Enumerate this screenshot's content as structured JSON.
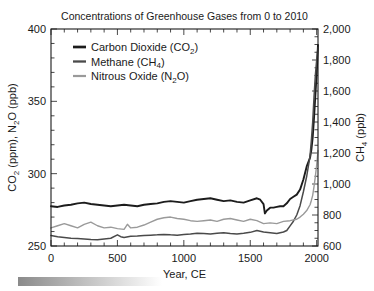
{
  "chart_data": {
    "type": "line",
    "title": "Concentrations of Greenhouse Gases from 0 to 2010",
    "xlabel": "Year, CE",
    "ylabel_left": "CO2 (ppm), N2O (ppb)",
    "ylabel_right": "CH4 (ppb)",
    "ylabel_left_parts": [
      "CO",
      "2",
      " (ppm), N",
      "2",
      "O (ppb)"
    ],
    "ylabel_right_parts": [
      "CH",
      "4",
      " (ppb)"
    ],
    "xlim": [
      0,
      2010
    ],
    "xticks": [
      0,
      500,
      1000,
      1500,
      2000
    ],
    "xtick_labels": [
      "0",
      "500",
      "1000",
      "1500",
      "2000"
    ],
    "x_minor_step": 100,
    "ylim_left": [
      250,
      400
    ],
    "yticks_left": [
      250,
      300,
      350,
      400
    ],
    "ytick_labels_left": [
      "250",
      "300",
      "350",
      "400"
    ],
    "y_left_minor_step": 10,
    "ylim_right": [
      600,
      2000
    ],
    "yticks_right": [
      600,
      800,
      1000,
      1200,
      1400,
      1600,
      1800,
      2000
    ],
    "ytick_labels_right": [
      "600",
      "800",
      "1,000",
      "1,200",
      "1,400",
      "1,600",
      "1,800",
      "2,000"
    ],
    "y_right_minor_step": 50,
    "grid": false,
    "legend_position": "upper-left-inside",
    "series": [
      {
        "name": "Carbon Dioxide (CO2)",
        "label_parts": [
          "Carbon Dioxide (CO",
          "2",
          ")"
        ],
        "axis": "left",
        "color": "#1c1c1c",
        "width": 1.9,
        "x": [
          0,
          50,
          100,
          150,
          200,
          250,
          300,
          350,
          400,
          450,
          500,
          550,
          600,
          650,
          700,
          750,
          800,
          850,
          900,
          950,
          1000,
          1050,
          1100,
          1150,
          1200,
          1250,
          1300,
          1350,
          1400,
          1450,
          1500,
          1550,
          1575,
          1600,
          1610,
          1625,
          1650,
          1675,
          1700,
          1725,
          1750,
          1775,
          1800,
          1825,
          1850,
          1875,
          1900,
          1925,
          1950,
          1960,
          1970,
          1980,
          1990,
          2000,
          2010
        ],
        "y": [
          277.5,
          277.0,
          278.0,
          278.5,
          279.5,
          280.0,
          279.0,
          278.5,
          278.0,
          277.5,
          278.0,
          278.5,
          278.0,
          277.5,
          278.5,
          279.0,
          279.5,
          280.5,
          281.0,
          280.5,
          280.0,
          281.0,
          282.0,
          282.5,
          283.0,
          282.0,
          281.0,
          281.5,
          280.5,
          280.0,
          281.5,
          283.0,
          282.0,
          279.0,
          272.5,
          274.5,
          276.5,
          276.5,
          277.0,
          277.5,
          277.5,
          279.5,
          282.5,
          284.0,
          285.5,
          289.0,
          296.0,
          305.0,
          311.0,
          316.5,
          325.0,
          338.5,
          354.0,
          369.0,
          389.0
        ]
      },
      {
        "name": "Methane (CH4)",
        "label_parts": [
          "Methane (CH",
          "4",
          ")"
        ],
        "axis": "right",
        "color": "#4a4a4a",
        "width": 1.5,
        "x": [
          0,
          50,
          100,
          150,
          200,
          250,
          300,
          350,
          400,
          450,
          500,
          525,
          550,
          600,
          650,
          700,
          750,
          800,
          850,
          900,
          950,
          1000,
          1050,
          1100,
          1150,
          1200,
          1250,
          1300,
          1350,
          1400,
          1450,
          1500,
          1550,
          1600,
          1650,
          1700,
          1750,
          1775,
          1800,
          1825,
          1850,
          1875,
          1900,
          1925,
          1950,
          1960,
          1970,
          1980,
          1990,
          2000,
          2010
        ],
        "y": [
          668,
          660,
          655,
          650,
          648,
          645,
          642,
          640,
          645,
          650,
          672,
          660,
          655,
          663,
          665,
          668,
          670,
          672,
          675,
          672,
          670,
          675,
          678,
          682,
          680,
          678,
          682,
          685,
          680,
          678,
          682,
          688,
          700,
          690,
          685,
          680,
          690,
          700,
          730,
          760,
          800,
          860,
          950,
          1050,
          1180,
          1280,
          1400,
          1560,
          1700,
          1800,
          1880
        ]
      },
      {
        "name": "Nitrous Oxide (N2O)",
        "label_parts": [
          "Nitrous Oxide (N",
          "2",
          "O)"
        ],
        "axis": "left",
        "color": "#9a9a9a",
        "width": 1.4,
        "x": [
          0,
          50,
          100,
          150,
          200,
          250,
          300,
          350,
          400,
          450,
          500,
          550,
          575,
          600,
          650,
          700,
          750,
          800,
          850,
          900,
          950,
          1000,
          1050,
          1100,
          1150,
          1200,
          1250,
          1300,
          1350,
          1400,
          1450,
          1500,
          1550,
          1600,
          1650,
          1700,
          1750,
          1800,
          1850,
          1875,
          1900,
          1925,
          1950,
          1960,
          1970,
          1980,
          1990,
          2000,
          2010
        ],
        "y": [
          262.5,
          264.0,
          265.5,
          264.0,
          262.5,
          265.0,
          266.5,
          264.0,
          262.5,
          263.0,
          262.0,
          261.5,
          265.0,
          262.5,
          263.0,
          264.5,
          266.5,
          268.5,
          269.5,
          270.0,
          269.0,
          268.5,
          267.5,
          267.0,
          267.5,
          268.0,
          267.0,
          268.5,
          269.0,
          268.0,
          267.0,
          268.5,
          267.5,
          265.5,
          266.0,
          265.5,
          267.0,
          267.5,
          268.5,
          270.0,
          272.0,
          274.5,
          278.5,
          281.5,
          285.0,
          291.0,
          298.0,
          306.0,
          316.0
        ]
      }
    ],
    "legend": [
      {
        "label": "Carbon Dioxide (CO2)"
      },
      {
        "label": "Methane (CH4)"
      },
      {
        "label": "Nitrous Oxide (N2O)"
      }
    ],
    "decoration": {
      "gradient_bar": {
        "from": "#8a8a8a",
        "to": "#ffffff"
      }
    },
    "colors": {
      "axis": "#1a1a1a",
      "background": "#ffffff",
      "co2": "#1c1c1c",
      "ch4": "#4a4a4a",
      "n2o": "#9a9a9a"
    }
  }
}
